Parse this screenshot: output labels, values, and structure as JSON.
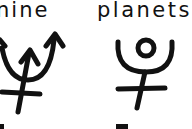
{
  "words": [
    "nine",
    "planets"
  ],
  "symbols": [
    {
      "name": "neptune-symbol",
      "glyph": "♆"
    },
    {
      "name": "pluto-symbol",
      "glyph": "⯓"
    }
  ],
  "colors": {
    "ink": "#111111",
    "paper": "#ffffff"
  }
}
